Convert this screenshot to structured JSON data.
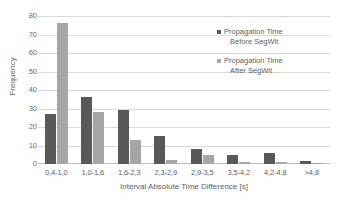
{
  "chart_data": {
    "type": "bar",
    "title": "",
    "xlabel": "Interval Absolute Time Difference [s]",
    "ylabel": "Frequency",
    "categories": [
      "0,4-1,0",
      "1,0-1,6",
      "1,6-2,3",
      "2,3-2,9",
      "2,9-3,5",
      "3,5-4,2",
      "4,2-4,8",
      ">4,8"
    ],
    "series": [
      {
        "name": "Propagation Time Before SegWit",
        "name_line1": "Propagation Time",
        "name_line2": "Before SegWit",
        "color": "#595959",
        "values": [
          27,
          36,
          29,
          15,
          8,
          5,
          6,
          1.5
        ]
      },
      {
        "name": "Propagation Time After SegWit",
        "name_line1": "Propagation Time",
        "name_line2": "After SegWit",
        "color": "#a6a6a6",
        "values": [
          76,
          28,
          13,
          2,
          5,
          1,
          1,
          0.8
        ]
      }
    ],
    "ylim": [
      0,
      80
    ],
    "yticks": [
      0,
      10,
      20,
      30,
      40,
      50,
      60,
      70,
      80
    ],
    "grid": true,
    "legend_position": "inside-top-right"
  }
}
